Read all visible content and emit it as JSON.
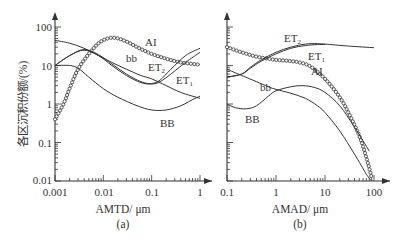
{
  "chart_data": [
    {
      "panel": "(a)",
      "type": "line",
      "title": "",
      "xlabel": "AMTD/ μm",
      "ylabel": "各区沉积份额/(%)",
      "xscale": "log",
      "yscale": "log",
      "xlim": [
        0.001,
        1
      ],
      "ylim": [
        0.01,
        100
      ],
      "xticks": [
        "0.001",
        "0.01",
        "0.1",
        "1"
      ],
      "yticks": [
        "0.01",
        "0.1",
        "1",
        "10",
        "100"
      ],
      "grid": false,
      "series": [
        {
          "name": "AI",
          "marker": "circle",
          "x": [
            0.001,
            0.0015,
            0.002,
            0.003,
            0.005,
            0.008,
            0.012,
            0.018,
            0.03,
            0.05,
            0.1,
            0.2,
            0.4,
            0.7,
            1.0
          ],
          "y": [
            0.4,
            1.0,
            2.5,
            8,
            20,
            38,
            50,
            52,
            42,
            30,
            20,
            15,
            12,
            11,
            10.5
          ]
        },
        {
          "name": "ET1",
          "x": [
            0.001,
            0.002,
            0.004,
            0.008,
            0.015,
            0.03,
            0.06,
            0.1,
            0.15,
            0.25,
            0.5,
            1.0
          ],
          "y": [
            10,
            18,
            25,
            18,
            10,
            5.5,
            3.6,
            3.3,
            3.8,
            6,
            12,
            22
          ]
        },
        {
          "name": "ET2",
          "x": [
            0.001,
            0.002,
            0.004,
            0.008,
            0.015,
            0.03,
            0.06,
            0.1,
            0.15,
            0.25,
            0.5,
            1.0
          ],
          "y": [
            10,
            18,
            26,
            19,
            11,
            6,
            3.8,
            3.4,
            4.2,
            8,
            18,
            28
          ]
        },
        {
          "name": "bb",
          "x": [
            0.001,
            0.002,
            0.004,
            0.008,
            0.015,
            0.03,
            0.06,
            0.1,
            0.2,
            0.4,
            1.0
          ],
          "y": [
            45,
            38,
            28,
            18,
            12,
            8,
            5.5,
            4.5,
            3,
            2,
            1.4
          ]
        },
        {
          "name": "BB",
          "x": [
            0.001,
            0.002,
            0.003,
            0.005,
            0.01,
            0.02,
            0.05,
            0.1,
            0.2,
            0.4,
            0.7,
            1.0
          ],
          "y": [
            10,
            10,
            8.5,
            5,
            2.5,
            1.5,
            0.9,
            0.7,
            0.7,
            0.9,
            1.3,
            1.6
          ]
        }
      ]
    },
    {
      "panel": "(b)",
      "type": "line",
      "title": "",
      "xlabel": "AMAD/ μm",
      "ylabel": "",
      "xscale": "log",
      "yscale": "log",
      "xlim": [
        0.1,
        100
      ],
      "ylim": [
        0.01,
        100
      ],
      "xticks": [
        "0.1",
        "1",
        "10",
        "100"
      ],
      "grid": false,
      "series": [
        {
          "name": "AI",
          "marker": "circle",
          "x": [
            0.1,
            0.2,
            0.4,
            0.7,
            1,
            2,
            3,
            5,
            10,
            20,
            30,
            50,
            70,
            90
          ],
          "y": [
            30,
            22,
            17,
            15,
            14,
            13,
            12,
            9.5,
            4.5,
            1.5,
            0.6,
            0.15,
            0.04,
            0.012
          ]
        },
        {
          "name": "ET2",
          "x": [
            0.1,
            0.2,
            0.3,
            0.5,
            1,
            2,
            4,
            7,
            10,
            30,
            100
          ],
          "y": [
            5,
            6,
            9,
            14,
            22,
            30,
            36,
            37,
            36,
            32,
            29
          ]
        },
        {
          "name": "ET1",
          "x": [
            0.1,
            0.2,
            0.3,
            0.5,
            1,
            2,
            4,
            7,
            10
          ],
          "y": [
            5,
            6,
            8.5,
            13,
            20,
            28,
            33,
            35,
            35
          ]
        },
        {
          "name": "bb",
          "x": [
            0.1,
            0.2,
            0.4,
            0.7,
            1,
            2,
            4,
            7,
            10,
            20,
            40,
            70,
            90
          ],
          "y": [
            8,
            5.5,
            3.8,
            2.8,
            2.4,
            1.9,
            1.4,
            0.9,
            0.6,
            0.2,
            0.05,
            0.015,
            0.01
          ]
        },
        {
          "name": "BB",
          "x": [
            0.1,
            0.15,
            0.25,
            0.4,
            0.7,
            1,
            2,
            3.5,
            6,
            10,
            20,
            40,
            80
          ],
          "y": [
            1.0,
            0.8,
            0.75,
            0.9,
            1.6,
            2.2,
            2.8,
            3.0,
            2.7,
            2.0,
            0.9,
            0.25,
            0.06
          ]
        }
      ]
    }
  ],
  "labels": {
    "ylabel": "各区沉积份额/(%)",
    "a": {
      "xlabel": "AMTD/ μm",
      "caption": "(a)",
      "xticks": [
        "0.001",
        "0.01",
        "0.1",
        "1"
      ],
      "yticks": [
        "0.01",
        "0.1",
        "1",
        "10",
        "100"
      ],
      "curves": {
        "AI": "AI",
        "bb": "bb",
        "ET2": "ET",
        "ET2_sub": "2",
        "ET1": "ET",
        "ET1_sub": "1",
        "BB": "BB"
      }
    },
    "b": {
      "xlabel": "AMAD/ μm",
      "caption": "(b)",
      "xticks": [
        "0.1",
        "1",
        "10",
        "100"
      ],
      "curves": {
        "AI": "AI",
        "bb": "bb",
        "ET2": "ET",
        "ET2_sub": "2",
        "ET1": "ET",
        "ET1_sub": "1",
        "BB": "BB"
      }
    }
  },
  "colors": {
    "line": "#333333",
    "text": "#333333",
    "background": "#ffffff"
  }
}
